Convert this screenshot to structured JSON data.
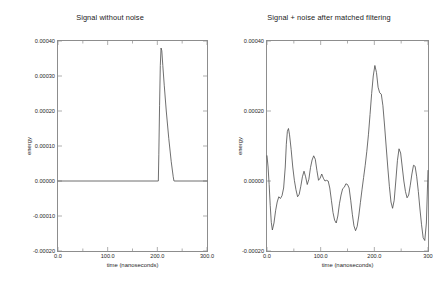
{
  "figure": {
    "background": "#ffffff",
    "line_color": "#4a4a4a",
    "axis_color": "#8d8d8d"
  },
  "chart_data": [
    {
      "type": "line",
      "panel": "left",
      "title": "Signal without noise",
      "xlabel": "time (nanoseconds)",
      "ylabel": "energy",
      "xlim": [
        0.0,
        300.0
      ],
      "ylim": [
        -0.0002,
        0.0004
      ],
      "grid": false,
      "legend": "none",
      "xticks": [
        0.0,
        100.0,
        200.0,
        300.0
      ],
      "xtick_labels": [
        "0.0",
        "100.0",
        "200.0",
        "300.0"
      ],
      "xminor_ticks": [
        50.0,
        150.0,
        250.0
      ],
      "yticks": [
        0.0004,
        0.0003,
        0.0002,
        0.0001,
        0.0,
        -0.0001,
        -0.0002
      ],
      "ytick_labels": [
        "0.00040",
        "0.00030",
        "0.00020",
        "0.00010",
        "0.00000",
        "-0.00010",
        "-0.00020"
      ],
      "series": [
        {
          "name": "signal",
          "x": [
            0.0,
            202.0,
            203.0,
            204.5,
            206.0,
            207.5,
            209.0,
            211.0,
            214.0,
            218.0,
            223.0,
            228.0,
            232.0,
            233.5,
            235.0,
            300.0
          ],
          "y": [
            0.0,
            0.0,
            7.5e-05,
            0.000215,
            0.00033,
            0.00038,
            0.000372,
            0.00033,
            0.000272,
            0.0002,
            0.000122,
            5.5e-05,
            1.2e-05,
            0.0,
            0.0,
            0.0
          ]
        }
      ]
    },
    {
      "type": "line",
      "panel": "right",
      "title": "Signal + noise after matched filtering",
      "xlabel": "time (nanoseconds)",
      "ylabel": "energy",
      "xlim": [
        0.0,
        300.0
      ],
      "ylim": [
        -0.0002,
        0.0004
      ],
      "grid": false,
      "legend": "none",
      "xticks": [
        0.0,
        100.0,
        200.0,
        300.0
      ],
      "xtick_labels": [
        "0.0",
        "100.0",
        "200.0",
        "300"
      ],
      "xminor_ticks": [
        50.0,
        150.0,
        250.0
      ],
      "yticks": [
        0.0004,
        0.0002,
        0.0,
        -0.0002
      ],
      "ytick_labels": [
        "0.00040",
        "0.00020",
        "0.00000",
        "-0.00020"
      ],
      "series": [
        {
          "name": "signal-plus-noise",
          "x": [
            0,
            2,
            4,
            6,
            8,
            10,
            13,
            16,
            19,
            22,
            25,
            28,
            31,
            34,
            36,
            38,
            40,
            42,
            45,
            48,
            51,
            54,
            57,
            60,
            63,
            66,
            69,
            72,
            75,
            78,
            81,
            84,
            87,
            90,
            93,
            96,
            99,
            102,
            105,
            108,
            111,
            114,
            117,
            120,
            123,
            126,
            129,
            132,
            135,
            138,
            141,
            144,
            147,
            150,
            153,
            156,
            159,
            162,
            165,
            168,
            171,
            174,
            177,
            180,
            183,
            186,
            189,
            192,
            195,
            198,
            201,
            204,
            207,
            210,
            213,
            216,
            219,
            222,
            225,
            228,
            231,
            234,
            237,
            240,
            243,
            246,
            249,
            252,
            255,
            258,
            261,
            264,
            267,
            270,
            273,
            276,
            279,
            282,
            285,
            288,
            291,
            294,
            297,
            300
          ],
          "y": [
            7.2e-05,
            4e-05,
            -1e-05,
            -7e-05,
            -0.000118,
            -0.00014,
            -0.00012,
            -8.5e-05,
            -6e-05,
            -4.5e-05,
            -5e-05,
            -4.2e-05,
            -2e-05,
            4e-05,
            0.000105,
            0.000142,
            0.00015,
            0.000132,
            9e-05,
            4e-05,
            2e-06,
            -2.5e-05,
            -4.5e-05,
            -3.8e-05,
            -1.5e-05,
            1.2e-05,
            2.8e-05,
            1.2e-05,
            -1e-05,
            5e-06,
            3.8e-05,
            6e-05,
            7.2e-05,
            6.2e-05,
            3e-05,
            2e-06,
            8e-06,
            2e-05,
            8e-06,
            0.0,
            2e-06,
            0.0,
            -2e-05,
            -5.5e-05,
            -9e-05,
            -0.000112,
            -0.00012,
            -0.0001,
            -6.5e-05,
            -4e-05,
            -2.2e-05,
            -1.8e-05,
            -8e-06,
            -1e-05,
            -2e-05,
            -5.5e-05,
            -9.5e-05,
            -0.000128,
            -0.000142,
            -0.00013,
            -0.0001,
            -6.2e-05,
            -2.5e-05,
            1e-05,
            4.5e-05,
            8.5e-05,
            0.000132,
            0.00019,
            0.00025,
            0.0003,
            0.00033,
            0.00031,
            0.000268,
            0.000252,
            0.000248,
            0.000215,
            0.00016,
            0.0001,
            4e-05,
            -1.5e-05,
            -6e-05,
            -7.8e-05,
            -5.5e-05,
            0.0,
            5.8e-05,
            9.2e-05,
            8e-05,
            4e-05,
            0.0,
            -3e-05,
            -4.8e-05,
            -4e-05,
            -1.2e-05,
            2e-05,
            4.5e-05,
            4.2e-05,
            1.2e-05,
            -3e-05,
            -8e-05,
            -0.000125,
            -0.000162,
            -0.00017,
            -0.00012,
            3e-05
          ]
        }
      ]
    }
  ]
}
